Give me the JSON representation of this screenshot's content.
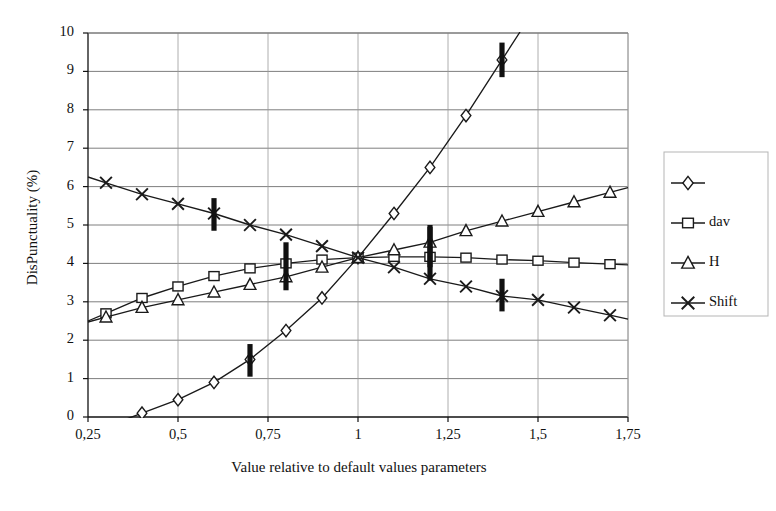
{
  "chart_data": {
    "type": "line",
    "title": "",
    "xlabel": "Value relative to default values parameters",
    "ylabel": "DisPunctuality (%)",
    "xlim": [
      0.25,
      1.75
    ],
    "ylim": [
      0,
      10
    ],
    "grid": true,
    "legend_position": "right",
    "xticks": [
      "0,25",
      "0,5",
      "0,75",
      "1",
      "1,25",
      "1,5",
      "1,75"
    ],
    "xtick_values": [
      0.25,
      0.5,
      0.75,
      1,
      1.25,
      1.5,
      1.75
    ],
    "yticks": [
      "0",
      "1",
      "2",
      "3",
      "4",
      "5",
      "6",
      "7",
      "8",
      "9",
      "10"
    ],
    "ytick_values": [
      0,
      1,
      2,
      3,
      4,
      5,
      6,
      7,
      8,
      9,
      10
    ],
    "decimal_separator": ",",
    "x": [
      0.3,
      0.4,
      0.5,
      0.6,
      0.7,
      0.8,
      0.9,
      1.0,
      1.1,
      1.2,
      1.3,
      1.4,
      1.5,
      1.6,
      1.7
    ],
    "series": [
      {
        "name": "",
        "marker": "diamond",
        "color": "#1a1a1a",
        "values": [
          null,
          0.1,
          0.45,
          0.9,
          1.5,
          2.25,
          3.1,
          4.15,
          5.3,
          6.5,
          7.85,
          9.3,
          null,
          null,
          null
        ],
        "error_bars": [
          {
            "x": 0.7,
            "y": 1.5,
            "low": 1.05,
            "high": 1.9
          },
          {
            "x": 1.4,
            "y": 9.3,
            "low": 8.85,
            "high": 9.75
          }
        ]
      },
      {
        "name": "dav",
        "marker": "square",
        "color": "#1a1a1a",
        "values": [
          2.7,
          3.1,
          3.4,
          3.67,
          3.87,
          4.0,
          4.1,
          4.15,
          4.17,
          4.17,
          4.15,
          4.1,
          4.07,
          4.02,
          3.98
        ],
        "error_bars": [
          {
            "x": 0.8,
            "y": 4.0,
            "low": 3.3,
            "high": 4.55
          },
          {
            "x": 1.2,
            "y": 4.17,
            "low": 3.55,
            "high": 4.95
          }
        ]
      },
      {
        "name": "H",
        "marker": "triangle",
        "color": "#1a1a1a",
        "values": [
          2.6,
          2.85,
          3.05,
          3.25,
          3.45,
          3.65,
          3.9,
          4.15,
          4.35,
          4.55,
          4.85,
          5.1,
          5.35,
          5.6,
          5.85
        ],
        "error_bars": [
          {
            "x": 1.2,
            "y": 4.55,
            "low": 3.9,
            "high": 5.0
          }
        ]
      },
      {
        "name": "Shift",
        "marker": "cross",
        "color": "#1a1a1a",
        "values": [
          6.1,
          5.8,
          5.55,
          5.3,
          5.0,
          4.75,
          4.45,
          4.15,
          3.9,
          3.6,
          3.4,
          3.15,
          3.05,
          2.85,
          2.65
        ],
        "error_bars": [
          {
            "x": 0.6,
            "y": 5.3,
            "low": 4.85,
            "high": 5.7
          },
          {
            "x": 1.4,
            "y": 3.15,
            "low": 2.75,
            "high": 3.6
          }
        ]
      }
    ],
    "legend_entries": [
      {
        "label": "",
        "marker": "diamond"
      },
      {
        "label": "dav",
        "marker": "square"
      },
      {
        "label": "H",
        "marker": "triangle"
      },
      {
        "label": "Shift",
        "marker": "cross"
      }
    ]
  }
}
